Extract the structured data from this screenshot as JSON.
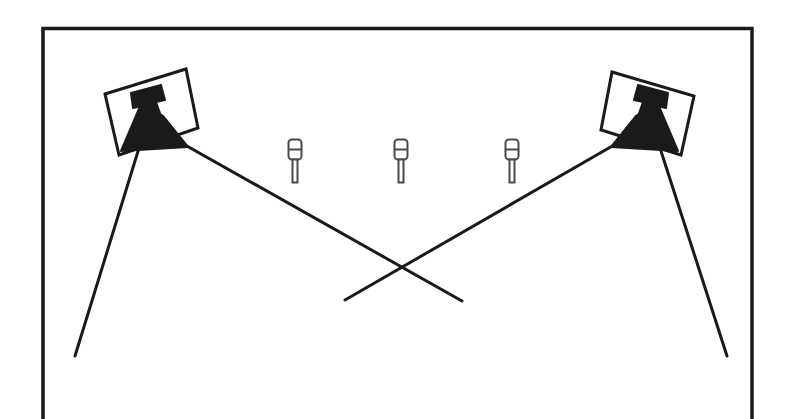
{
  "figure": {
    "kind": "technical-line-diagram",
    "background_color": "#ffffff",
    "ink_color": "#1a1a1a",
    "canvas": {
      "width": 792,
      "height": 419
    }
  },
  "enclosure": {
    "name": "chamber-outline",
    "description": "open-bottom rectangular frame border",
    "stroke_color": "#1a1a1a",
    "stroke_width": 3.5,
    "left": 43,
    "right": 752,
    "top": 27,
    "bottom_open_at": 419,
    "bottom_edge_visible": false
  },
  "antennas": [
    {
      "name": "left-horn-antenna",
      "label": "",
      "mount_frame": {
        "corners": [
          [
            105,
            94
          ],
          [
            186,
            69
          ],
          [
            198,
            128
          ],
          [
            119,
            155
          ]
        ],
        "stroke_color": "#1a1a1a",
        "stroke_width": 3
      },
      "horn": {
        "fill_color": "#1a1a1a",
        "aperture_direction": "down-left",
        "flange_corners": [
          [
            129,
            94
          ],
          [
            160,
            86
          ],
          [
            164,
            100
          ],
          [
            155,
            103
          ],
          [
            160,
            118
          ],
          [
            138,
            122
          ],
          [
            140,
            107
          ],
          [
            132,
            108
          ]
        ],
        "flare_corners": [
          [
            140,
            105
          ],
          [
            160,
            116
          ],
          [
            186,
            146
          ],
          [
            122,
            150
          ]
        ]
      }
    },
    {
      "name": "right-horn-antenna",
      "label": "",
      "mount_frame": {
        "corners": [
          [
            612,
            72
          ],
          [
            694,
            96
          ],
          [
            681,
            155
          ],
          [
            601,
            130
          ]
        ],
        "stroke_color": "#1a1a1a",
        "stroke_width": 3
      },
      "horn": {
        "fill_color": "#1a1a1a",
        "aperture_direction": "down-right",
        "flange_corners": [
          [
            639,
            88
          ],
          [
            670,
            96
          ],
          [
            662,
            110
          ],
          [
            654,
            107
          ],
          [
            659,
            123
          ],
          [
            637,
            118
          ],
          [
            641,
            103
          ],
          [
            633,
            101
          ]
        ],
        "flare_corners": [
          [
            659,
            122
          ],
          [
            639,
            112
          ],
          [
            613,
            146
          ],
          [
            677,
            150
          ]
        ]
      }
    }
  ],
  "beam_lines": [
    {
      "name": "left-antenna-outer-beam",
      "from": [
        139,
        148
      ],
      "to": [
        75,
        356
      ],
      "stroke_width": 3
    },
    {
      "name": "left-antenna-crossing-beam",
      "from": [
        178,
        141
      ],
      "to": [
        462,
        301
      ],
      "stroke_width": 3
    },
    {
      "name": "right-antenna-outer-beam",
      "from": [
        660,
        148
      ],
      "to": [
        727,
        356
      ],
      "stroke_width": 3
    },
    {
      "name": "right-antenna-crossing-beam",
      "from": [
        621,
        141
      ],
      "to": [
        345,
        300
      ],
      "stroke_width": 3
    }
  ],
  "beam_crossing_point": {
    "x": 403,
    "y": 266
  },
  "probes": {
    "name": "probe-row",
    "count": 3,
    "description": "three identical upright probe targets with capped heads and thin stems",
    "stroke_color": "#4a4a4a",
    "stroke_width": 2,
    "head_width": 13,
    "head_height": 20,
    "stem_width": 5,
    "stem_height": 23,
    "items": [
      {
        "name": "probe-1",
        "x": 295,
        "y": 139
      },
      {
        "name": "probe-2",
        "x": 401,
        "y": 139
      },
      {
        "name": "probe-3",
        "x": 512,
        "y": 139
      }
    ]
  }
}
